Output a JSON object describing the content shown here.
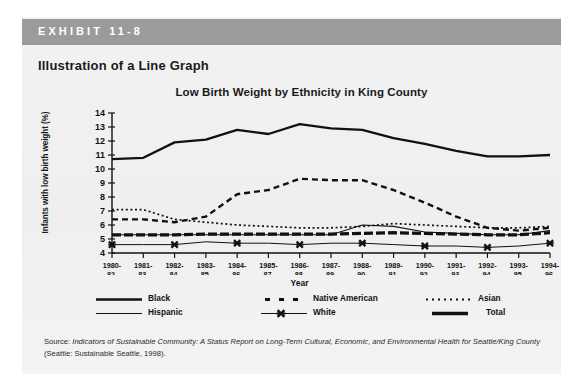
{
  "exhibit": {
    "label": "EXHIBIT 11-8",
    "title": "Illustration of a Line Graph",
    "bar_color": "#9b9b9b",
    "panel_color": "#f1f1f1"
  },
  "chart_data": {
    "type": "line",
    "title": "Low Birth Weight by Ethnicity in King County",
    "xlabel": "Year",
    "ylabel": "Infants with low birth weight (%)",
    "ylim": [
      4,
      14
    ],
    "yticks": [
      4,
      5,
      6,
      7,
      8,
      9,
      10,
      11,
      12,
      13,
      14
    ],
    "grid": false,
    "legend_position": "bottom",
    "categories": [
      "1980-82",
      "1981-83",
      "1982-84",
      "1983-85",
      "1984-86",
      "1985-87",
      "1986-88",
      "1987-89",
      "1988-90",
      "1989-91",
      "1990-92",
      "1991-93",
      "1992-94",
      "1993-95",
      "1994-96"
    ],
    "category_lines": [
      [
        "1980-",
        "82"
      ],
      [
        "1981-",
        "83"
      ],
      [
        "1982-",
        "84"
      ],
      [
        "1983-",
        "85"
      ],
      [
        "1984-",
        "86"
      ],
      [
        "1985-",
        "87"
      ],
      [
        "1986-",
        "88"
      ],
      [
        "1987-",
        "89"
      ],
      [
        "1988-",
        "90"
      ],
      [
        "1989-",
        "91"
      ],
      [
        "1990-",
        "92"
      ],
      [
        "1991-",
        "93"
      ],
      [
        "1992-",
        "94"
      ],
      [
        "1993-",
        "95"
      ],
      [
        "1994-",
        "96"
      ]
    ],
    "series": [
      {
        "name": "Black",
        "style": "solid-thick",
        "values": [
          10.7,
          10.8,
          11.9,
          12.1,
          12.8,
          12.5,
          13.2,
          12.9,
          12.8,
          12.2,
          11.8,
          11.3,
          10.9,
          10.9,
          11.0
        ]
      },
      {
        "name": "Native American",
        "style": "dashed",
        "values": [
          6.4,
          6.4,
          6.2,
          6.6,
          8.2,
          8.5,
          9.3,
          9.2,
          9.2,
          8.5,
          7.6,
          6.6,
          5.8,
          5.6,
          5.8
        ]
      },
      {
        "name": "Asian",
        "style": "dotted",
        "values": [
          7.1,
          7.1,
          6.4,
          6.2,
          6.0,
          5.9,
          5.8,
          5.8,
          5.9,
          6.1,
          6.0,
          5.9,
          5.8,
          5.8,
          5.9
        ]
      },
      {
        "name": "Hispanic",
        "style": "solid-thin",
        "values": [
          5.3,
          5.3,
          5.3,
          5.3,
          5.3,
          5.3,
          5.3,
          5.3,
          6.0,
          5.9,
          5.5,
          5.4,
          5.3,
          5.3,
          5.6
        ]
      },
      {
        "name": "White",
        "style": "solid-marker-x",
        "values": [
          4.6,
          4.6,
          4.6,
          4.8,
          4.7,
          4.7,
          4.6,
          4.7,
          4.7,
          4.6,
          4.5,
          4.5,
          4.4,
          4.5,
          4.7
        ]
      },
      {
        "name": "Total",
        "style": "dashed-thick",
        "values": [
          5.3,
          5.3,
          5.3,
          5.35,
          5.35,
          5.35,
          5.35,
          5.35,
          5.4,
          5.45,
          5.4,
          5.35,
          5.3,
          5.3,
          5.45
        ]
      }
    ]
  },
  "legend": [
    {
      "label": "Black",
      "style": "solid-thick"
    },
    {
      "label": "Native American",
      "style": "dashed"
    },
    {
      "label": "Asian",
      "style": "dotted"
    },
    {
      "label": "Hispanic",
      "style": "solid-thin"
    },
    {
      "label": "White",
      "style": "solid-marker-x"
    },
    {
      "label": "Total",
      "style": "dashed-thick"
    }
  ],
  "source": {
    "prefix": "Source: ",
    "italic_part": "Indicators of Sustainable Community: A Status Report on Long-Term Cultural, Economic, and Environmental Health for Seattle/King County",
    "suffix": " (Seattle: Sustainable Seattle, 1998)."
  }
}
